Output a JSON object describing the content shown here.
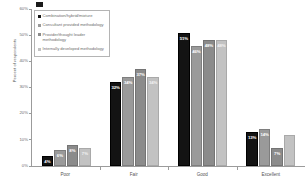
{
  "chart_data": {
    "type": "bar",
    "title": "",
    "xlabel": "",
    "ylabel": "Percent of respondents",
    "ylim": [
      0,
      60
    ],
    "ytick_labels": [
      "0%",
      "10%",
      "20%",
      "30%",
      "40%",
      "50%",
      "60%"
    ],
    "ytick_values": [
      0,
      10,
      20,
      30,
      40,
      50,
      60
    ],
    "grid": false,
    "legend_position": "top-left",
    "categories": [
      "Poor",
      "Fair",
      "Good",
      "Excellent"
    ],
    "series": [
      {
        "name": "Combination/hybrid/mixture",
        "color": "#131313",
        "values": [
          4,
          32,
          51,
          13
        ],
        "labels": [
          "4%",
          "32%",
          "51%",
          "13%"
        ]
      },
      {
        "name": "Consultant provided methodology",
        "color": "#9a9a9a",
        "values": [
          6,
          34,
          46,
          14
        ],
        "labels": [
          "6%",
          "34%",
          "46%",
          "14%"
        ]
      },
      {
        "name": "Provider/thought leader methodology",
        "color": "#8b8b8b",
        "values": [
          8,
          37,
          48,
          7
        ],
        "labels": [
          "8%",
          "37%",
          "48%",
          "7%"
        ]
      },
      {
        "name": "Internally developed methodology",
        "color": "#c2c2c2",
        "values": [
          7,
          34,
          48,
          12
        ],
        "labels": [
          "7%",
          "34%",
          "48%",
          ""
        ]
      }
    ]
  }
}
